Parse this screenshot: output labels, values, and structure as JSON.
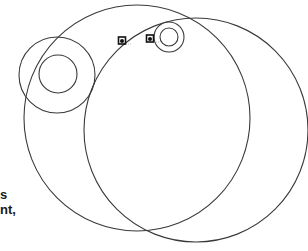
{
  "diagram": {
    "stroke_color": "#3a3a3a",
    "background": "#ffffff",
    "circles": [
      {
        "name": "large-circle-left",
        "cx": 137,
        "cy": 118,
        "r": 113
      },
      {
        "name": "large-circle-right",
        "cx": 196,
        "cy": 130,
        "r": 112
      },
      {
        "name": "left-ring-outer",
        "cx": 57,
        "cy": 75,
        "r": 38
      },
      {
        "name": "left-ring-inner",
        "cx": 58,
        "cy": 74,
        "r": 19
      },
      {
        "name": "top-ring-outer",
        "cx": 169,
        "cy": 37,
        "r": 15
      },
      {
        "name": "top-ring-inner",
        "cx": 169,
        "cy": 37,
        "r": 9
      }
    ],
    "markers": [
      {
        "name": "marker-left",
        "x": 122,
        "y": 41
      },
      {
        "name": "marker-right",
        "x": 150,
        "y": 39
      }
    ]
  },
  "text_fragments": [
    {
      "text": "s",
      "top": 188
    },
    {
      "text": "nt,",
      "top": 203
    }
  ]
}
